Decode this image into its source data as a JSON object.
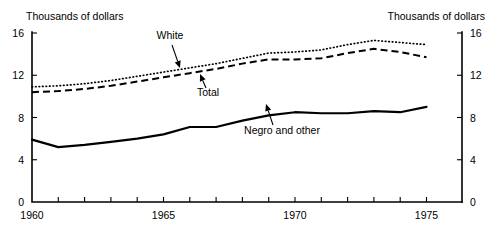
{
  "chart_data": {
    "type": "line",
    "title": "",
    "xlabel": "",
    "ylabel": "Thousands of dollars",
    "ylabel_right": "Thousands of dollars",
    "xlim": [
      1960,
      1975
    ],
    "ylim": [
      0,
      16
    ],
    "grid": false,
    "legend_position": "inline-annotations",
    "y_ticks": [
      0,
      4,
      8,
      12,
      16
    ],
    "y_tick_labels": [
      "0",
      "4",
      "8",
      "12",
      "16"
    ],
    "y_ticks_right": [
      0,
      4,
      8,
      12,
      16
    ],
    "y_tick_labels_right": [
      "0",
      "4",
      "8",
      "12",
      "16"
    ],
    "x_ticks": [
      1960,
      1961,
      1962,
      1963,
      1964,
      1965,
      1966,
      1967,
      1968,
      1969,
      1970,
      1971,
      1972,
      1973,
      1974,
      1975
    ],
    "x_tick_labels_shown": [
      "1960",
      "1965",
      "1970",
      "1975"
    ],
    "x_labeled_ticks": [
      1960,
      1965,
      1970,
      1975
    ],
    "x": [
      1960,
      1961,
      1962,
      1963,
      1964,
      1965,
      1966,
      1967,
      1968,
      1969,
      1970,
      1971,
      1972,
      1973,
      1974,
      1975
    ],
    "series": [
      {
        "name": "White",
        "style": "dotted",
        "values": [
          10.9,
          11.0,
          11.2,
          11.5,
          11.9,
          12.3,
          12.7,
          13.1,
          13.6,
          14.1,
          14.2,
          14.4,
          14.9,
          15.3,
          15.1,
          14.9
        ]
      },
      {
        "name": "Total",
        "style": "dashed",
        "values": [
          10.4,
          10.5,
          10.7,
          11.0,
          11.4,
          11.8,
          12.2,
          12.6,
          13.1,
          13.5,
          13.5,
          13.6,
          14.1,
          14.5,
          14.2,
          13.7
        ]
      },
      {
        "name": "Negro and other",
        "style": "solid",
        "values": [
          5.9,
          5.2,
          5.4,
          5.7,
          6.0,
          6.4,
          7.1,
          7.1,
          7.7,
          8.2,
          8.5,
          8.4,
          8.4,
          8.6,
          8.5,
          9.0
        ]
      }
    ],
    "annotations": [
      {
        "label": "White",
        "target_x": 1966.6,
        "target_y": 12.9
      },
      {
        "label": "Total",
        "target_x": 1967.8,
        "target_y": 12.8
      },
      {
        "label": "Negro and other",
        "target_x": 1969.2,
        "target_y": 8.4
      }
    ]
  }
}
